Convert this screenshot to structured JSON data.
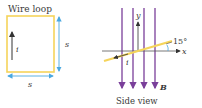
{
  "left_panel": {
    "title": "Wire loop",
    "current_label": "i",
    "side_label_right": "s",
    "side_label_bottom": "s"
  },
  "right_panel": {
    "caption": "Side view",
    "y_axis_label": "y",
    "x_axis_label": "x",
    "angle_label": "15°",
    "current_label": "i",
    "field_label": "B",
    "field_line_count": 4
  },
  "colors": {
    "loop": "#f5d45a",
    "dimension": "#4aa8e0",
    "field": "#7a3f9a",
    "axis": "#444444",
    "text": "#3a3a3a"
  }
}
